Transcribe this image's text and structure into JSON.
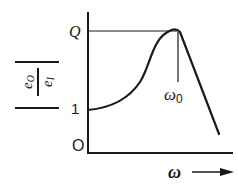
{
  "figure": {
    "type": "resonance-curve",
    "stroke_color": "#1a1a1a",
    "background": "#ffffff"
  },
  "y_axis": {
    "label_numerator": "e",
    "label_numerator_sub": "O",
    "label_denominator": "e",
    "label_denominator_sub": "I",
    "ticks": [
      {
        "label": "Q",
        "level": "peak"
      },
      {
        "label": "1",
        "level": "baseline"
      },
      {
        "label": "O",
        "level": "origin"
      }
    ]
  },
  "x_axis": {
    "label": "ω",
    "arrow": "→"
  },
  "peak": {
    "label": "ω",
    "label_sub": "0"
  },
  "labels": {
    "q": "Q",
    "one": "1",
    "zero": "O",
    "omega0": "ω",
    "omega0_sub": "0",
    "omega": "ω"
  }
}
